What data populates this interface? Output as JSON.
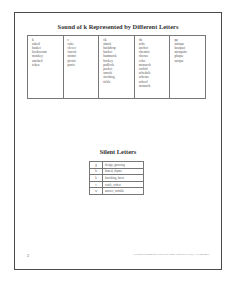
{
  "document": {
    "title": "Sound of k Represented by Different Letters",
    "k_table": {
      "columns": [
        {
          "header": "k",
          "words": [
            "asked",
            "basket",
            "bookworm",
            "monkey",
            "smoked",
            "token"
          ]
        },
        {
          "header": "c",
          "words": [
            "cake",
            "clever",
            "fascist",
            "mimic",
            "picnic",
            "panic"
          ]
        },
        {
          "header": "ck",
          "words": [
            "attack",
            "backdrop",
            "bucket",
            "hammock",
            "hockey",
            "padlock",
            "pocket",
            "smack",
            "stocking",
            "tickle"
          ]
        },
        {
          "header": "ch",
          "words": [
            "ache",
            "anchor",
            "chemist",
            "chorus",
            "echo",
            "monarch",
            "orchid",
            "schedule",
            "scheme",
            "school",
            "stomach"
          ]
        },
        {
          "header": "qu",
          "words": [
            "antique",
            "bouquet",
            "mosquito",
            "plaque",
            "unique"
          ]
        }
      ]
    },
    "silent_title": "Silent Letters",
    "silent_table": [
      {
        "letter": "g",
        "words": "design, gnawing"
      },
      {
        "letter": "h",
        "words": "honest, rhyme"
      },
      {
        "letter": "k",
        "words": "knocking, knew"
      },
      {
        "letter": "t",
        "words": "castle, soften"
      },
      {
        "letter": "w",
        "words": "answer, wrinkle"
      }
    ],
    "page_number": "2",
    "footer": "Section 2.2 Sound of k Spelled as Many Different Letters, All Phonemes"
  }
}
